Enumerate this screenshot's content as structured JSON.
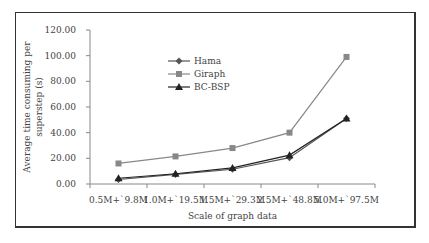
{
  "chart_data": {
    "type": "line",
    "title": "",
    "xlabel": "Scale of graph data",
    "ylabel": "Average time consuming per superstep (s)",
    "ylabel_lines": [
      "Average time consuming per",
      "superstep (s)"
    ],
    "categories": [
      "0.5M+~9.8M",
      "1.0M+~19.5M",
      "1.5M+~29.3M",
      "2.5M+~48.8M",
      "5.0M+~97.5M"
    ],
    "category_labels": [
      "0.5M+`9.8M",
      "1.0M+`19.5M",
      "1.5M+`29.3M",
      "2.5M+`48.8M",
      "5.0M+`97.5M"
    ],
    "ylim": [
      0,
      120
    ],
    "yticks": [
      "0.00",
      "20.00",
      "40.00",
      "60.00",
      "80.00",
      "100.00",
      "120.00"
    ],
    "grid": false,
    "legend_position": "upper-left-inside",
    "series": [
      {
        "name": "Hama",
        "marker": "diamond",
        "color": "#555555",
        "values": [
          3.5,
          7.5,
          11.5,
          20.5,
          51
        ]
      },
      {
        "name": "Giraph",
        "marker": "square",
        "color": "#888888",
        "values": [
          16,
          21.5,
          28,
          40,
          99
        ]
      },
      {
        "name": "BC-BSP",
        "marker": "triangle",
        "color": "#222222",
        "values": [
          4.5,
          8,
          12.5,
          22.5,
          51
        ]
      }
    ]
  }
}
